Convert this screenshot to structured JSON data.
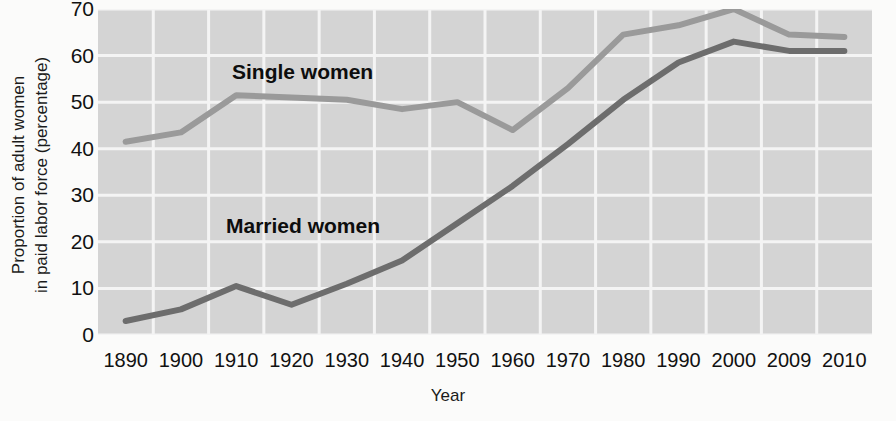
{
  "chart_data": {
    "type": "line",
    "title": "",
    "xlabel": "Year",
    "ylabel": "Proportion of adult women in paid labor force (percentage)",
    "ylabel_line1": "Proportion of adult women",
    "ylabel_line2": "in paid labor force (percentage)",
    "grid": true,
    "legend_position": "inline-annotation",
    "xlim": [
      1890,
      2010
    ],
    "ylim": [
      0,
      70
    ],
    "categories": [
      "1890",
      "1900",
      "1910",
      "1920",
      "1930",
      "1940",
      "1950",
      "1960",
      "1970",
      "1980",
      "1990",
      "2000",
      "2009",
      "2010"
    ],
    "x_tick_labels": [
      "1890",
      "1900",
      "1910",
      "1920",
      "1930",
      "1940",
      "1950",
      "1960",
      "1970",
      "1980",
      "1990",
      "2000",
      "2009",
      "2010"
    ],
    "y_tick_labels": [
      "0",
      "10",
      "20",
      "30",
      "40",
      "50",
      "60",
      "70"
    ],
    "y_ticks": [
      0,
      10,
      20,
      30,
      40,
      50,
      60,
      70
    ],
    "series": [
      {
        "name": "Single women",
        "color": "#9a9a9a",
        "label_x_index": 3,
        "values": [
          41.5,
          43.5,
          51.5,
          51.0,
          50.5,
          48.5,
          50.0,
          44.0,
          53.0,
          64.5,
          66.5,
          70.0,
          64.5,
          64.0
        ]
      },
      {
        "name": "Married women",
        "color": "#6d6d6d",
        "label_x_index": 3,
        "values": [
          3.0,
          5.5,
          10.5,
          6.5,
          11.0,
          16.0,
          24.0,
          32.0,
          41.0,
          50.5,
          58.5,
          63.0,
          61.0,
          61.0
        ]
      }
    ],
    "annotations": [
      {
        "text": "Single women",
        "x_px": 232,
        "y_px": 60
      },
      {
        "text": "Married women",
        "x_px": 226,
        "y_px": 214
      }
    ],
    "plot_bg": "#d4d4d4",
    "grid_color": "#f4f4f4"
  }
}
